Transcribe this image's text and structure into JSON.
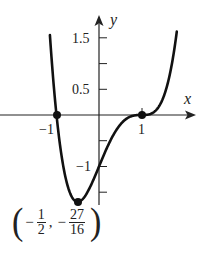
{
  "chart_data": {
    "type": "line",
    "title": "",
    "function": "f(x) = (x+1)(x-1)^3",
    "xlabel": "x",
    "ylabel": "y",
    "x_ticks": [
      {
        "value": -1,
        "label": "−1"
      },
      {
        "value": 1,
        "label": "1"
      }
    ],
    "y_ticks": [
      {
        "value": 1.5,
        "label": "1.5"
      },
      {
        "value": 1,
        "label": ""
      },
      {
        "value": 0.5,
        "label": "0.5"
      },
      {
        "value": -0.5,
        "label": ""
      },
      {
        "value": -1,
        "label": "−1"
      },
      {
        "value": -1.5,
        "label": ""
      }
    ],
    "xlim": [
      -2.3,
      2.3
    ],
    "ylim": [
      -1.75,
      1.9
    ],
    "grid": false,
    "marked_points": [
      {
        "x": -1,
        "y": 0
      },
      {
        "x": 1,
        "y": 0
      },
      {
        "x": -0.5,
        "y": -1.6875
      }
    ],
    "annotations": [
      {
        "text": "(−1/2, −27/16)",
        "x": -0.5,
        "y": -1.6875
      }
    ],
    "series": [
      {
        "name": "f(x)",
        "x": [
          -1.15,
          -1.1,
          -1.0,
          -0.9,
          -0.75,
          -0.5,
          -0.25,
          0.0,
          0.25,
          0.5,
          0.75,
          1.0,
          1.25,
          1.5,
          1.7,
          1.82
        ],
        "y": [
          1.48,
          1.06,
          0.0,
          -0.69,
          -1.32,
          -1.6875,
          -1.49,
          -1.0,
          -0.53,
          -0.19,
          -0.03,
          0.0,
          0.03,
          0.31,
          0.92,
          1.55
        ]
      }
    ]
  },
  "labels": {
    "x_axis": "x",
    "y_axis": "y",
    "y_tick_1_5": "1.5",
    "y_tick_0_5": "0.5",
    "y_tick_neg1": "−1",
    "x_tick_neg1": "−1",
    "x_tick_1": "1"
  },
  "min_point_label": {
    "sign1": "−",
    "frac1_num": "1",
    "frac1_den": "2",
    "comma": ",",
    "sign2": "−",
    "frac2_num": "27",
    "frac2_den": "16",
    "open_paren": "(",
    "close_paren": ")"
  }
}
